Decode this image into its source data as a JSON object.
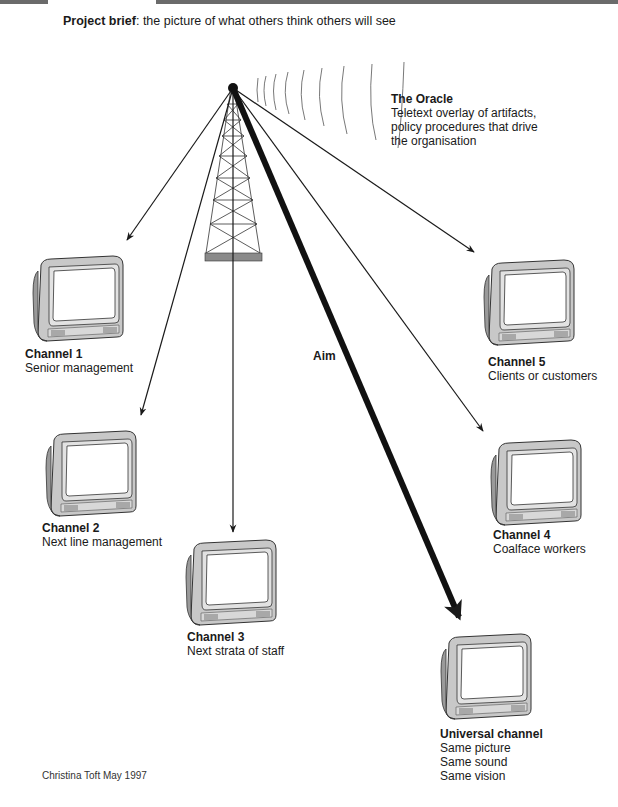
{
  "header": {
    "brief_label": "Project brief",
    "brief_text": ": the picture of what others think others will see"
  },
  "oracle": {
    "title": "The Oracle",
    "lines": [
      "Teletext overlay of artifacts,",
      "policy procedures that drive",
      "the organisation"
    ]
  },
  "aim_label": "Aim",
  "channels": [
    {
      "title": "Channel 1",
      "lines": [
        "Senior management"
      ]
    },
    {
      "title": "Channel 2",
      "lines": [
        "Next line management"
      ]
    },
    {
      "title": "Channel 3",
      "lines": [
        "Next strata of staff"
      ]
    },
    {
      "title": "Channel 4",
      "lines": [
        "Coalface workers"
      ]
    },
    {
      "title": "Channel 5",
      "lines": [
        "Clients or customers"
      ]
    },
    {
      "title": "Universal channel",
      "lines": [
        "Same picture",
        "Same sound",
        "Same vision"
      ]
    }
  ],
  "credit": "Christina Toft May 1997",
  "colors": {
    "line": "#1a1a1a",
    "tv_body": "#c8c8c8",
    "tv_shadow": "#9a9a9a",
    "tv_screen": "#ffffff",
    "tower_base": "#8a8a8a",
    "topbar": "#6b6b6b"
  }
}
